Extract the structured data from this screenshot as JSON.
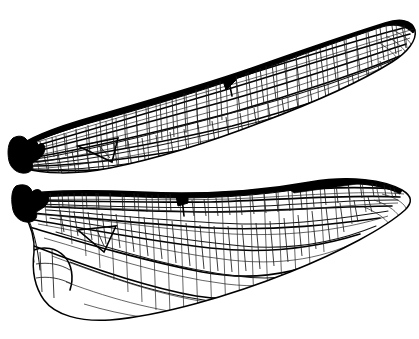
{
  "figure": {
    "title": "Dragonfly wings",
    "background_color": "#ffffff",
    "ink_color": "#000000",
    "caption": "",
    "labels": []
  },
  "specimens": [
    {
      "id": "forewing",
      "name": "Forewing",
      "position": "upper",
      "orientation": "base at left, apex at upper right, tilted upward",
      "base_point": [
        13,
        155
      ],
      "apex_point": [
        415,
        30
      ],
      "features": [
        {
          "name": "wing-base",
          "note": "solid black thickened articulation"
        },
        {
          "name": "costal-margin",
          "note": "leading edge, heavy black line"
        },
        {
          "name": "nodus",
          "note": "dark notch on costal margin near mid-wing",
          "at": [
            228,
            78
          ]
        },
        {
          "name": "pterostigma",
          "note": "elongate solid black cell on costal margin near apex",
          "at": [
            330,
            12
          ]
        },
        {
          "name": "discoidal-triangle",
          "note": "triangular cell near wing base",
          "at": [
            100,
            152
          ]
        },
        {
          "name": "antenodal-crossveins",
          "note": "ladder of crossveins between base and nodus"
        },
        {
          "name": "postnodal-crossveins",
          "note": "crossveins between nodus and pterostigma"
        },
        {
          "name": "membrane-cells",
          "note": "dense irregular polygonal cell network"
        }
      ]
    },
    {
      "id": "hindwing",
      "name": "Hindwing",
      "position": "lower",
      "orientation": "base at left, apex at right, broad anal area",
      "base_point": [
        16,
        200
      ],
      "apex_point": [
        412,
        200
      ],
      "features": [
        {
          "name": "wing-base",
          "note": "solid black thickened articulation"
        },
        {
          "name": "costal-margin",
          "note": "leading edge, heavy black line"
        },
        {
          "name": "nodus",
          "note": "dark notch on costal margin near mid-wing",
          "at": [
            182,
            205
          ]
        },
        {
          "name": "pterostigma",
          "note": "elongate solid black cell on costal margin near apex",
          "at": [
            322,
            176
          ]
        },
        {
          "name": "discoidal-triangle",
          "note": "triangular cell near wing base",
          "at": [
            98,
            250
          ]
        },
        {
          "name": "anal-loop",
          "note": "expanded rounded anal field at base of hindwing",
          "at": [
            60,
            285
          ]
        },
        {
          "name": "anal-lobe",
          "note": "rounded basal lobe of trailing margin"
        },
        {
          "name": "membrane-cells",
          "note": "dense irregular polygonal cell network"
        }
      ]
    }
  ],
  "rendering": {
    "cell_stroke_width": 0.85,
    "margin_stroke_width": 2.4,
    "cell_mean_size_px": 10,
    "marginal_cell_size_px": 5
  }
}
